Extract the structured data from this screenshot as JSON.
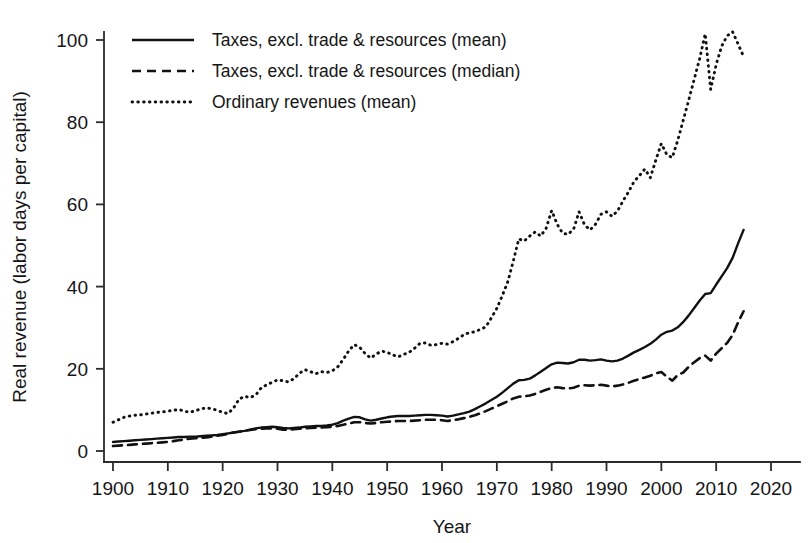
{
  "chart_data": {
    "type": "line",
    "title": "",
    "xlabel": "Year",
    "ylabel": "Real revenue (labor days per capital)",
    "xlim": [
      1900,
      2020
    ],
    "ylim": [
      0,
      104
    ],
    "xticks": [
      1900,
      1910,
      1920,
      1930,
      1940,
      1950,
      1960,
      1970,
      1980,
      1990,
      2000,
      2010,
      2020
    ],
    "yticks": [
      0,
      20,
      40,
      60,
      80,
      100
    ],
    "grid": false,
    "legend_position": "top-left",
    "series": [
      {
        "name": "Taxes, excl. trade & resources (mean)",
        "style": "solid",
        "x": [
          1900,
          1901,
          1902,
          1903,
          1904,
          1905,
          1906,
          1907,
          1908,
          1909,
          1910,
          1911,
          1912,
          1913,
          1914,
          1915,
          1916,
          1917,
          1918,
          1919,
          1920,
          1921,
          1922,
          1923,
          1924,
          1925,
          1926,
          1927,
          1928,
          1929,
          1930,
          1931,
          1932,
          1933,
          1934,
          1935,
          1936,
          1937,
          1938,
          1939,
          1940,
          1941,
          1942,
          1943,
          1944,
          1945,
          1946,
          1947,
          1948,
          1949,
          1950,
          1951,
          1952,
          1953,
          1954,
          1955,
          1956,
          1957,
          1958,
          1959,
          1960,
          1961,
          1962,
          1963,
          1964,
          1965,
          1966,
          1967,
          1968,
          1969,
          1970,
          1971,
          1972,
          1973,
          1974,
          1975,
          1976,
          1977,
          1978,
          1979,
          1980,
          1981,
          1982,
          1983,
          1984,
          1985,
          1986,
          1987,
          1988,
          1989,
          1990,
          1991,
          1992,
          1993,
          1994,
          1995,
          1996,
          1997,
          1998,
          1999,
          2000,
          2001,
          2002,
          2003,
          2004,
          2005,
          2006,
          2007,
          2008,
          2009,
          2010,
          2011,
          2012,
          2013,
          2014,
          2015
        ],
        "values": [
          2.2,
          2.3,
          2.4,
          2.5,
          2.6,
          2.7,
          2.8,
          2.9,
          3.0,
          3.1,
          3.2,
          3.3,
          3.4,
          3.4,
          3.5,
          3.5,
          3.6,
          3.7,
          3.8,
          3.9,
          4.1,
          4.3,
          4.5,
          4.7,
          4.9,
          5.2,
          5.5,
          5.7,
          5.8,
          5.9,
          5.8,
          5.6,
          5.5,
          5.6,
          5.7,
          5.9,
          6.0,
          6.1,
          6.1,
          6.2,
          6.4,
          6.8,
          7.4,
          7.9,
          8.3,
          8.2,
          7.7,
          7.4,
          7.6,
          7.9,
          8.2,
          8.4,
          8.5,
          8.5,
          8.5,
          8.6,
          8.7,
          8.8,
          8.8,
          8.7,
          8.6,
          8.4,
          8.6,
          8.9,
          9.2,
          9.6,
          10.2,
          10.9,
          11.6,
          12.4,
          13.2,
          14.2,
          15.3,
          16.4,
          17.2,
          17.3,
          17.6,
          18.4,
          19.3,
          20.2,
          21.1,
          21.5,
          21.4,
          21.3,
          21.6,
          22.2,
          22.2,
          22.0,
          22.1,
          22.3,
          22.0,
          21.8,
          22.0,
          22.5,
          23.2,
          24.0,
          24.6,
          25.3,
          26.1,
          27.1,
          28.3,
          29.0,
          29.3,
          30.1,
          31.4,
          33.0,
          34.8,
          36.6,
          38.2,
          38.4,
          40.5,
          42.5,
          44.5,
          47.0,
          50.5,
          53.8
        ]
      },
      {
        "name": "Taxes, excl. trade & resources (median)",
        "style": "dashed",
        "x": [
          1900,
          1901,
          1902,
          1903,
          1904,
          1905,
          1906,
          1907,
          1908,
          1909,
          1910,
          1911,
          1912,
          1913,
          1914,
          1915,
          1916,
          1917,
          1918,
          1919,
          1920,
          1921,
          1922,
          1923,
          1924,
          1925,
          1926,
          1927,
          1928,
          1929,
          1930,
          1931,
          1932,
          1933,
          1934,
          1935,
          1936,
          1937,
          1938,
          1939,
          1940,
          1941,
          1942,
          1943,
          1944,
          1945,
          1946,
          1947,
          1948,
          1949,
          1950,
          1951,
          1952,
          1953,
          1954,
          1955,
          1956,
          1957,
          1958,
          1959,
          1960,
          1961,
          1962,
          1963,
          1964,
          1965,
          1966,
          1967,
          1968,
          1969,
          1970,
          1971,
          1972,
          1973,
          1974,
          1975,
          1976,
          1977,
          1978,
          1979,
          1980,
          1981,
          1982,
          1983,
          1984,
          1985,
          1986,
          1987,
          1988,
          1989,
          1990,
          1991,
          1992,
          1993,
          1994,
          1995,
          1996,
          1997,
          1998,
          1999,
          2000,
          2001,
          2002,
          2003,
          2004,
          2005,
          2006,
          2007,
          2008,
          2009,
          2010,
          2011,
          2012,
          2013,
          2014,
          2015
        ],
        "values": [
          1.2,
          1.3,
          1.4,
          1.5,
          1.6,
          1.7,
          1.8,
          1.9,
          2.0,
          2.1,
          2.2,
          2.4,
          2.6,
          2.8,
          3.0,
          3.1,
          3.2,
          3.3,
          3.5,
          3.7,
          3.9,
          4.2,
          4.5,
          4.7,
          4.9,
          5.1,
          5.3,
          5.4,
          5.5,
          5.5,
          5.4,
          5.2,
          5.2,
          5.3,
          5.4,
          5.5,
          5.6,
          5.7,
          5.7,
          5.8,
          5.9,
          6.1,
          6.4,
          6.7,
          7.0,
          7.0,
          6.8,
          6.7,
          6.8,
          7.0,
          7.1,
          7.2,
          7.3,
          7.3,
          7.3,
          7.4,
          7.5,
          7.6,
          7.6,
          7.6,
          7.5,
          7.3,
          7.5,
          7.7,
          8.0,
          8.3,
          8.7,
          9.2,
          9.7,
          10.3,
          10.9,
          11.5,
          12.1,
          12.8,
          13.2,
          13.3,
          13.5,
          13.9,
          14.4,
          14.9,
          15.3,
          15.5,
          15.3,
          15.2,
          15.4,
          15.9,
          16.0,
          15.9,
          16.0,
          16.1,
          15.9,
          15.7,
          15.9,
          16.2,
          16.6,
          17.1,
          17.5,
          17.9,
          18.3,
          18.9,
          19.2,
          18.1,
          17.1,
          18.5,
          19.1,
          20.5,
          21.6,
          22.6,
          23.2,
          22.0,
          23.7,
          25.0,
          26.3,
          28.2,
          31.3,
          34.0
        ]
      },
      {
        "name": "Ordinary revenues (mean)",
        "style": "dotted",
        "x": [
          1900,
          1901,
          1902,
          1903,
          1904,
          1905,
          1906,
          1907,
          1908,
          1909,
          1910,
          1911,
          1912,
          1913,
          1914,
          1915,
          1916,
          1917,
          1918,
          1919,
          1920,
          1921,
          1922,
          1923,
          1924,
          1925,
          1926,
          1927,
          1928,
          1929,
          1930,
          1931,
          1932,
          1933,
          1934,
          1935,
          1936,
          1937,
          1938,
          1939,
          1940,
          1941,
          1942,
          1943,
          1944,
          1945,
          1946,
          1947,
          1948,
          1949,
          1950,
          1951,
          1952,
          1953,
          1954,
          1955,
          1956,
          1957,
          1958,
          1959,
          1960,
          1961,
          1962,
          1963,
          1964,
          1965,
          1966,
          1967,
          1968,
          1969,
          1970,
          1971,
          1972,
          1973,
          1974,
          1975,
          1976,
          1977,
          1978,
          1979,
          1980,
          1981,
          1982,
          1983,
          1984,
          1985,
          1986,
          1987,
          1988,
          1989,
          1990,
          1991,
          1992,
          1993,
          1994,
          1995,
          1996,
          1997,
          1998,
          1999,
          2000,
          2001,
          2002,
          2003,
          2004,
          2005,
          2006,
          2007,
          2008,
          2009,
          2010,
          2011,
          2012,
          2013,
          2014,
          2015
        ],
        "values": [
          7.0,
          7.6,
          8.2,
          8.5,
          8.7,
          8.8,
          9.0,
          9.2,
          9.4,
          9.5,
          9.7,
          9.9,
          10.1,
          9.7,
          9.4,
          9.8,
          10.2,
          10.5,
          10.3,
          9.9,
          9.4,
          9.1,
          10.5,
          12.6,
          13.3,
          13.0,
          13.6,
          15.3,
          16.1,
          16.7,
          17.3,
          17.1,
          16.8,
          17.6,
          18.9,
          19.8,
          19.3,
          18.8,
          19.3,
          19.1,
          19.5,
          20.5,
          22.3,
          24.4,
          25.9,
          25.2,
          23.7,
          22.6,
          23.6,
          24.3,
          24.0,
          23.4,
          22.9,
          23.5,
          24.0,
          25.0,
          26.2,
          26.3,
          25.7,
          25.9,
          26.2,
          26.0,
          26.6,
          27.4,
          28.3,
          28.8,
          29.0,
          29.6,
          30.2,
          32.4,
          34.7,
          37.8,
          41.2,
          46.2,
          51.6,
          51.1,
          52.3,
          53.3,
          52.3,
          54.2,
          58.5,
          55.2,
          53.0,
          52.7,
          54.0,
          58.2,
          55.0,
          53.8,
          55.2,
          57.6,
          58.2,
          57.1,
          58.4,
          60.8,
          63.0,
          65.5,
          67.0,
          68.6,
          66.5,
          70.8,
          74.8,
          72.1,
          71.4,
          75.6,
          80.5,
          85.4,
          90.5,
          95.5,
          101.5,
          88.0,
          94.0,
          98.5,
          101.0,
          102.0,
          99.0,
          96.0
        ]
      }
    ]
  },
  "legend": {
    "items": [
      {
        "label": "Taxes, excl. trade & resources (mean)",
        "style": "solid"
      },
      {
        "label": "Taxes, excl. trade & resources (median)",
        "style": "dashed"
      },
      {
        "label": "Ordinary revenues (mean)",
        "style": "dotted"
      }
    ]
  },
  "axes": {
    "x_title": "Year",
    "y_title": "Real revenue (labor days per capital)",
    "x_tick_labels": [
      "1900",
      "1910",
      "1920",
      "1930",
      "1940",
      "1950",
      "1960",
      "1970",
      "1980",
      "1990",
      "2000",
      "2010",
      "2020"
    ],
    "y_tick_labels": [
      "0",
      "20",
      "40",
      "60",
      "80",
      "100"
    ]
  },
  "colors": {
    "line": "#111111",
    "axis": "#2b2b2b",
    "text": "#151515",
    "background": "#ffffff"
  }
}
